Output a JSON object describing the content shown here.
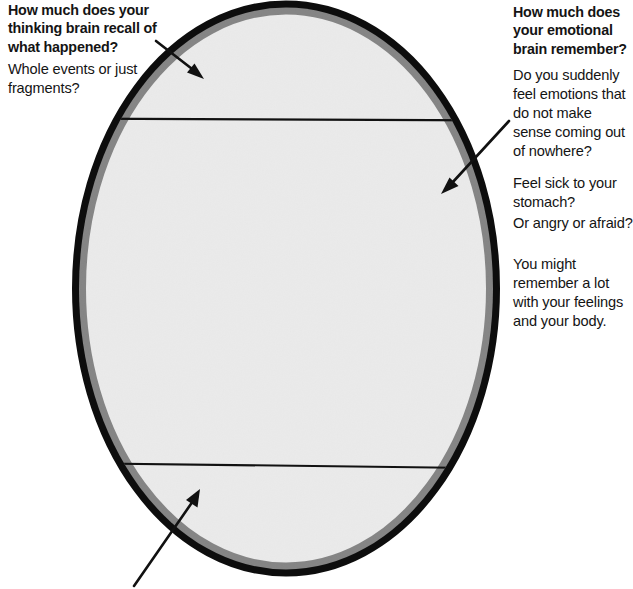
{
  "figure": {
    "shape": {
      "name": "ellipse",
      "fill_color": "#eeeeee",
      "stroke_color": "#0d0d0d",
      "divider_line_color": "#111111",
      "divider_count": 2
    }
  },
  "left_column": {
    "heading": "How much does your thinking brain recall of what happened?",
    "paragraphs": [
      "Whole events or just fragments?"
    ]
  },
  "right_column": {
    "heading": "How much does your emotional brain remember?",
    "paragraphs": [
      "Do you suddenly feel emotions that do not make sense coming out of nowhere?",
      "Feel sick to your stomach?",
      "Or angry or afraid?",
      "You might remember a lot with your feelings and your body."
    ]
  },
  "annotations": {
    "arrows": [
      {
        "name": "top-left-arrow",
        "points_to": "upper band of ellipse"
      },
      {
        "name": "right-arrow",
        "points_to": "middle band of ellipse"
      },
      {
        "name": "bottom-left-arrow",
        "points_to": "lower band of ellipse"
      }
    ]
  }
}
